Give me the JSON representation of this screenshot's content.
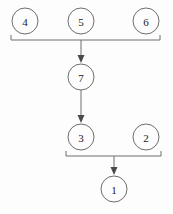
{
  "diagram": {
    "background_color": "#fdfdfd",
    "stroke_color": "#6e6e6e",
    "text_color": "#1a1a1a",
    "node_radius": 13,
    "nodes": [
      {
        "id": "n4",
        "label": "4",
        "cx": 25,
        "cy": 21,
        "name": "node-4"
      },
      {
        "id": "n5",
        "label": "5",
        "cx": 81,
        "cy": 21,
        "name": "node-5"
      },
      {
        "id": "n6",
        "label": "6",
        "cx": 146,
        "cy": 21,
        "name": "node-6"
      },
      {
        "id": "n7",
        "label": "7",
        "cx": 81,
        "cy": 77,
        "name": "node-7"
      },
      {
        "id": "n3",
        "label": "3",
        "cx": 81,
        "cy": 137,
        "name": "node-3"
      },
      {
        "id": "n2",
        "label": "2",
        "cx": 146,
        "cy": 137,
        "name": "node-2"
      },
      {
        "id": "n1",
        "label": "1",
        "cx": 114,
        "cy": 189,
        "name": "node-1"
      }
    ],
    "brackets": [
      {
        "name": "bracket-top",
        "left": 11,
        "right": 160,
        "y": 40,
        "tick": 5,
        "members": [
          "4",
          "5",
          "6"
        ],
        "stem_x": 81
      },
      {
        "name": "bracket-bottom",
        "left": 66,
        "right": 161,
        "y": 156,
        "tick": 5,
        "members": [
          "3",
          "2"
        ],
        "stem_x": 114
      }
    ],
    "edges": [
      {
        "name": "edge-group456-to-7",
        "from": "bracket-top",
        "to": "7",
        "x": 81,
        "y1": 40,
        "y2": 62,
        "arrow": true
      },
      {
        "name": "edge-7-to-3",
        "from": "7",
        "to": "3",
        "x": 81,
        "y1": 90,
        "y2": 122,
        "arrow": true
      },
      {
        "name": "edge-group32-to-1",
        "from": "bracket-bottom",
        "to": "1",
        "x": 114,
        "y1": 156,
        "y2": 174,
        "arrow": true
      }
    ],
    "flow_description": "Nodes 4, 5 and 6 are grouped and flow into node 7; node 7 flows into node 3; nodes 3 and 2 are grouped and flow into node 1."
  }
}
